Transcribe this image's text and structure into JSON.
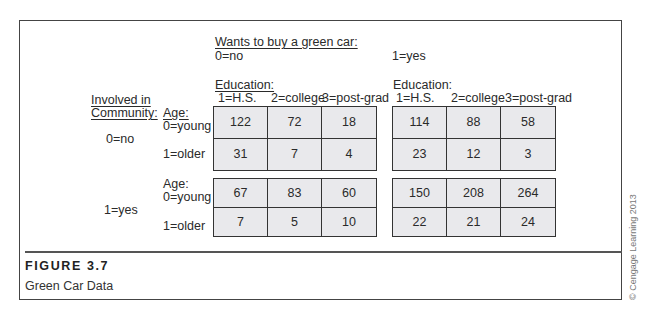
{
  "figure": {
    "label": "FIGURE 3.7",
    "caption": "Green Car Data",
    "copyright": "© Cengage Learning 2013"
  },
  "headers": {
    "outcome_label": "Wants to buy a green car:",
    "outcome_no": "0=no",
    "outcome_yes": "1=yes",
    "education_label_left": "Education:",
    "education_label_right": "Education:",
    "education_levels": [
      "1=H.S.",
      "2=college",
      "3=post-grad"
    ],
    "community_label_line1": "Involved in",
    "community_label_line2": "Community:",
    "community_no": "0=no",
    "community_yes": "1=yes",
    "age_label": "Age:",
    "age_young": "0=young",
    "age_older": "1=older"
  },
  "tables": {
    "community_no": {
      "buy_no": {
        "young": [
          "122",
          "72",
          "18"
        ],
        "older": [
          "31",
          "7",
          "4"
        ]
      },
      "buy_yes": {
        "young": [
          "114",
          "88",
          "58"
        ],
        "older": [
          "23",
          "12",
          "3"
        ]
      }
    },
    "community_yes": {
      "buy_no": {
        "young": [
          "67",
          "83",
          "60"
        ],
        "older": [
          "7",
          "5",
          "10"
        ]
      },
      "buy_yes": {
        "young": [
          "150",
          "208",
          "264"
        ],
        "older": [
          "22",
          "21",
          "24"
        ]
      }
    }
  },
  "colors": {
    "cell_fill": "#e9e9ec",
    "border": "#333333",
    "text": "#2a2a2a"
  }
}
